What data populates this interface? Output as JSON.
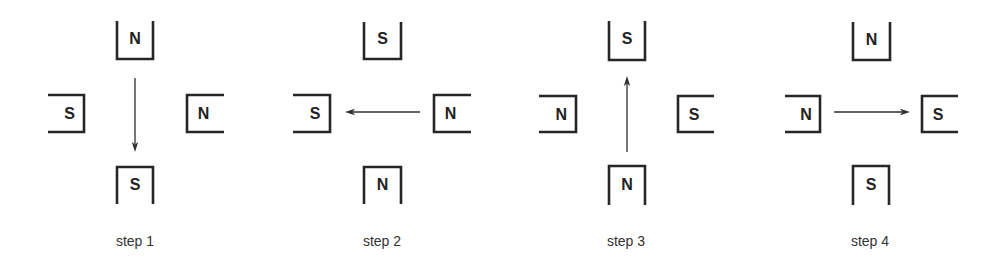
{
  "figure": {
    "colors": {
      "line": "#262626",
      "text": "#222222",
      "label": "#333333",
      "background": "#ffffff"
    },
    "steps": [
      {
        "label": "step 1",
        "label_x": 135,
        "arrow": {
          "direction": "down",
          "from": [
            135,
            78
          ],
          "to": [
            135,
            152
          ]
        },
        "magnets": {
          "top": {
            "pole": "N",
            "box": [
              117,
              21,
              153,
              59
            ]
          },
          "left": {
            "pole": "S",
            "box": [
              48,
              95,
              84,
              132
            ]
          },
          "right": {
            "pole": "N",
            "box": [
              187,
              95,
              224,
              132
            ]
          },
          "bottom": {
            "pole": "S",
            "box": [
              117,
              167,
              153,
              204
            ]
          }
        }
      },
      {
        "label": "step 2",
        "label_x": 382,
        "arrow": {
          "direction": "left",
          "from": [
            420,
            112
          ],
          "to": [
            345,
            112
          ]
        },
        "magnets": {
          "top": {
            "pole": "S",
            "box": [
              364,
              22,
              401,
              59
            ]
          },
          "left": {
            "pole": "S",
            "box": [
              293,
              95,
              330,
              132
            ]
          },
          "right": {
            "pole": "N",
            "box": [
              434,
              95,
              471,
              132
            ]
          },
          "bottom": {
            "pole": "N",
            "box": [
              364,
              167,
              401,
              204
            ]
          }
        }
      },
      {
        "label": "step 3",
        "label_x": 626,
        "arrow": {
          "direction": "up",
          "from": [
            627,
            152
          ],
          "to": [
            627,
            76
          ]
        },
        "magnets": {
          "top": {
            "pole": "S",
            "box": [
              609,
              21,
              645,
              60
            ]
          },
          "left": {
            "pole": "N",
            "box": [
              539,
              96,
              576,
              132
            ]
          },
          "right": {
            "pole": "S",
            "box": [
              678,
              96,
              714,
              132
            ]
          },
          "bottom": {
            "pole": "N",
            "box": [
              609,
              166,
              645,
              205
            ]
          }
        }
      },
      {
        "label": "step 4",
        "label_x": 870,
        "arrow": {
          "direction": "right",
          "from": [
            834,
            112
          ],
          "to": [
            910,
            112
          ]
        },
        "magnets": {
          "top": {
            "pole": "N",
            "box": [
              853,
              22,
              890,
              60
            ]
          },
          "left": {
            "pole": "N",
            "box": [
              785,
              96,
              820,
              132
            ]
          },
          "right": {
            "pole": "S",
            "box": [
              922,
              96,
              958,
              132
            ]
          },
          "bottom": {
            "pole": "S",
            "box": [
              853,
              166,
              889,
              205
            ]
          }
        }
      }
    ],
    "label_y": 246
  }
}
